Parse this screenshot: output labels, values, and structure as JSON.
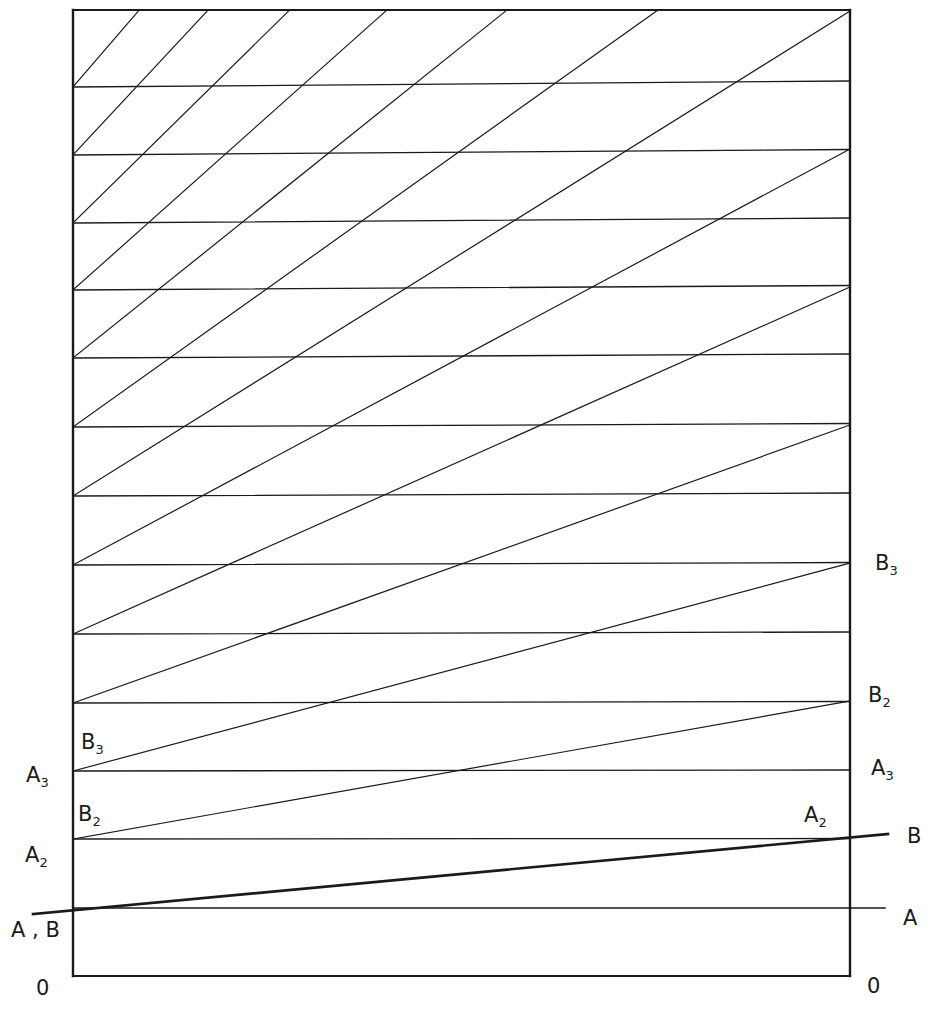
{
  "diagram": {
    "stroke_color": "#1a1a1a",
    "background": "#ffffff",
    "frame": {
      "left": 73,
      "right": 850,
      "top": 10,
      "bottom": 976
    },
    "rungs_y": [
      908,
      839,
      771,
      703,
      634,
      565,
      496,
      427,
      358,
      290,
      223,
      155,
      87
    ],
    "line_A": {
      "x1": 73,
      "y1": 908,
      "x2": 885,
      "y2": 908
    },
    "line_B": {
      "x1": 33,
      "y1": 914,
      "x2": 888,
      "y2": 834
    },
    "labels": {
      "left_zero": "0",
      "right_zero": "0",
      "left_AB": "A , B",
      "left_A2": "A",
      "left_A2_sub": "2",
      "left_B2": "B",
      "left_B2_sub": "2",
      "left_A3": "A",
      "left_A3_sub": "3",
      "left_B3": "B",
      "left_B3_sub": "3",
      "right_A": "A",
      "right_B": "B",
      "right_A2": "A",
      "right_A2_sub": "2",
      "right_A3": "A",
      "right_A3_sub": "3",
      "right_B2": "B",
      "right_B2_sub": "2",
      "right_B3": "B",
      "right_B3_sub": "3"
    }
  }
}
